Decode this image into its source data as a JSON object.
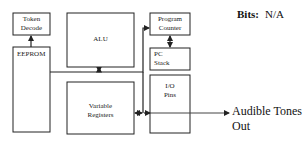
{
  "header": {
    "bits_label": "Bits:",
    "bits_value": "N/A"
  },
  "blocks": {
    "token_decode": {
      "line1": "Token",
      "line2": "Decode"
    },
    "eeprom": {
      "line1": "EEPROM"
    },
    "alu": {
      "line1": "ALU"
    },
    "variable_registers": {
      "line1": "Variable",
      "line2": "Registers"
    },
    "program_counter": {
      "line1": "Program",
      "line2": "Counter"
    },
    "pc_stack": {
      "line1": "PC",
      "line2": "Stack"
    },
    "io_pins": {
      "line1": "I/O",
      "line2": "Pins"
    }
  },
  "output": {
    "line1": "Audible Tones",
    "line2": "Out"
  },
  "colors": {
    "stroke": "#222222",
    "background": "#ffffff"
  }
}
